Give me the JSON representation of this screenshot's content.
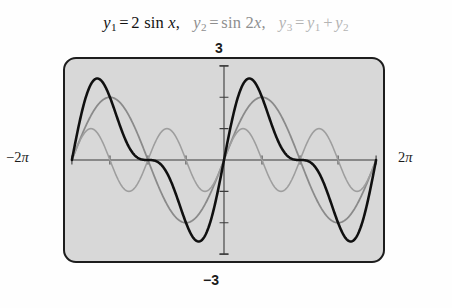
{
  "figure": {
    "title_parts": [
      {
        "name": "y1",
        "lhs": "y",
        "sub": "1",
        "rhs": "2 sin x",
        "color": "#121212",
        "trailing": ","
      },
      {
        "name": "y2",
        "lhs": "y",
        "sub": "2",
        "rhs": "sin 2x",
        "color": "#8e8e8e",
        "trailing": ","
      },
      {
        "name": "y3",
        "lhs": "y",
        "sub": "3",
        "rhs": "y1 + y2",
        "color": "#b4b4b4",
        "trailing": ""
      }
    ],
    "title_text": "y1 = 2 sin x,  y2 = sin 2x,  y3 = y1 + y2",
    "panel_color": "#d8d8d8",
    "border_color": "#1d1d1d"
  },
  "labels": {
    "x_min": "-2",
    "x_min_unit": "π",
    "x_max": "2",
    "x_max_unit": "π",
    "y_max": "3",
    "y_min": "−3"
  },
  "chart_data": {
    "type": "line",
    "xlabel": "",
    "ylabel": "",
    "xlim": [
      -6.283185307,
      6.283185307
    ],
    "ylim": [
      -3,
      3
    ],
    "xtick_labels": [
      "-2π",
      "2π"
    ],
    "ytick_labels": [
      "3",
      "-3"
    ],
    "x_ticks_interval": 1.5707963,
    "y_ticks_interval": 1,
    "grid": false,
    "legend": false,
    "axes_style": "calculator-screen",
    "series": [
      {
        "name": "y1",
        "label": "y₁ = 2 sin x",
        "expression": "2*sin(x)",
        "amplitude": 2,
        "period": 6.283185307,
        "color": "#8a8a8a",
        "width": 1.8,
        "key_points": [
          {
            "x": -6.2832,
            "y": 0
          },
          {
            "x": -4.7124,
            "y": 2
          },
          {
            "x": -3.1416,
            "y": 0
          },
          {
            "x": -1.5708,
            "y": -2
          },
          {
            "x": 0,
            "y": 0
          },
          {
            "x": 1.5708,
            "y": 2
          },
          {
            "x": 3.1416,
            "y": 0
          },
          {
            "x": 4.7124,
            "y": -2
          },
          {
            "x": 6.2832,
            "y": 0
          }
        ]
      },
      {
        "name": "y2",
        "label": "y₂ = sin 2x",
        "expression": "sin(2*x)",
        "amplitude": 1,
        "period": 3.14159265,
        "color": "#9e9e9e",
        "width": 1.6,
        "key_points": [
          {
            "x": -6.2832,
            "y": 0
          },
          {
            "x": -5.4978,
            "y": 1
          },
          {
            "x": -4.7124,
            "y": 0
          },
          {
            "x": -3.927,
            "y": -1
          },
          {
            "x": -3.1416,
            "y": 0
          },
          {
            "x": -2.3562,
            "y": 1
          },
          {
            "x": -1.5708,
            "y": 0
          },
          {
            "x": -0.7854,
            "y": -1
          },
          {
            "x": 0,
            "y": 0
          },
          {
            "x": 0.7854,
            "y": 1
          },
          {
            "x": 1.5708,
            "y": 0
          },
          {
            "x": 2.3562,
            "y": -1
          },
          {
            "x": 3.1416,
            "y": 0
          },
          {
            "x": 3.927,
            "y": 1
          },
          {
            "x": 4.7124,
            "y": 0
          },
          {
            "x": 5.4978,
            "y": -1
          },
          {
            "x": 6.2832,
            "y": 0
          }
        ]
      },
      {
        "name": "y3",
        "label": "y₃ = y₁ + y₂",
        "expression": "2*sin(x)+sin(2*x)",
        "amplitude": 2.598,
        "period": 6.283185307,
        "color": "#101010",
        "width": 2.6,
        "key_points": [
          {
            "x": -6.2832,
            "y": 0
          },
          {
            "x": -5.236,
            "y": 2.598
          },
          {
            "x": -3.1416,
            "y": 0
          },
          {
            "x": -1.047,
            "y": -2.598
          },
          {
            "x": 0,
            "y": 0
          },
          {
            "x": 1.047,
            "y": 2.598
          },
          {
            "x": 3.1416,
            "y": 0
          },
          {
            "x": 5.236,
            "y": -2.598
          },
          {
            "x": 6.2832,
            "y": 0
          }
        ]
      }
    ]
  }
}
